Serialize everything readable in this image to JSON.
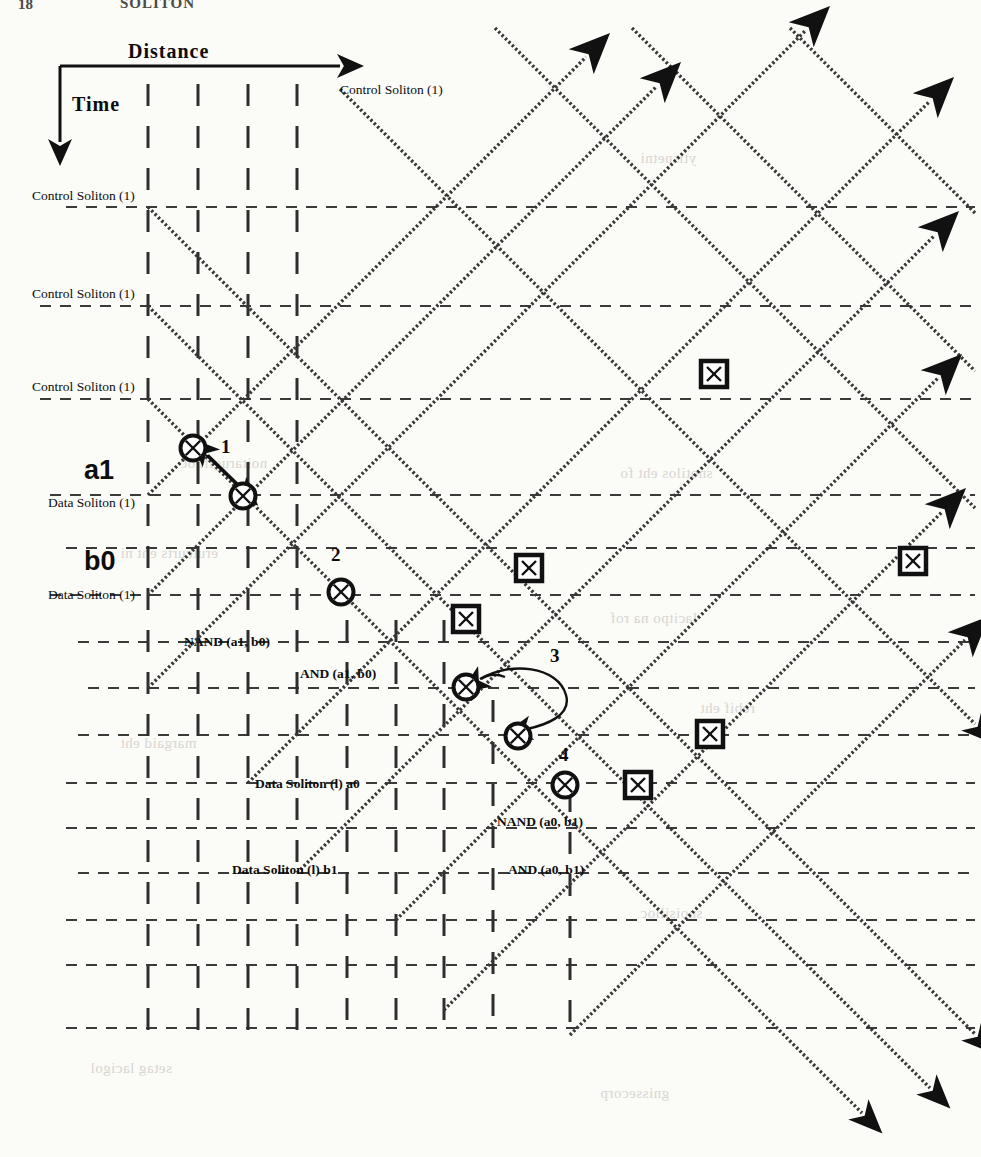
{
  "figure": {
    "type": "spacetime-soliton-collision-diagram",
    "axes": {
      "x_label": "Distance",
      "y_label": "Time"
    },
    "header_fragment": "SOLITON",
    "labels": {
      "control_soliton": "Control Soliton (1)",
      "data_soliton": "Data Soliton (1)",
      "data_soliton_a0": "Data Soliton (l) a0",
      "data_soliton_b1": "Data Soliton (l) b1",
      "nand_a1b0": "NAND (a1, b0)",
      "and_a1b0": "AND (a1, b0)",
      "nand_a0b1": "NAND (a0, b1)",
      "and_a0b1": "AND (a0, b1)",
      "a1": "a1",
      "b0": "b0"
    },
    "collision_numbers": [
      "1",
      "2",
      "3",
      "4"
    ],
    "annotations": [
      {
        "id": "control-soliton-top",
        "text": "Control Soliton (1)",
        "x": 340,
        "y": 89
      },
      {
        "id": "control-soliton-1",
        "text": "Control Soliton (1)",
        "x": 32,
        "y": 196
      },
      {
        "id": "control-soliton-2",
        "text": "Control Soliton (1)",
        "x": 32,
        "y": 293
      },
      {
        "id": "control-soliton-3",
        "text": "Control Soliton (1)",
        "x": 32,
        "y": 386
      },
      {
        "id": "data-soliton-a1",
        "text": "Data Soliton (1)",
        "x": 48,
        "y": 500
      },
      {
        "id": "data-soliton-b0",
        "text": "Data Soliton (1)",
        "x": 48,
        "y": 592
      },
      {
        "id": "label-a1",
        "text": "a1",
        "x": 88,
        "y": 463
      },
      {
        "id": "label-b0",
        "text": "b0",
        "x": 88,
        "y": 554
      },
      {
        "id": "nand-a1-b0",
        "text": "NAND (a1, b0)",
        "x": 185,
        "y": 641
      },
      {
        "id": "and-a1-b0",
        "text": "AND (a1, b0)",
        "x": 300,
        "y": 673
      },
      {
        "id": "data-soliton-a0",
        "text": "Data Soliton (l) a0",
        "x": 255,
        "y": 783
      },
      {
        "id": "nand-a0-b1",
        "text": "NAND (a0, b1)",
        "x": 497,
        "y": 821
      },
      {
        "id": "data-soliton-b1",
        "text": "Data Soliton (l) b1",
        "x": 235,
        "y": 869
      },
      {
        "id": "and-a0-b1",
        "text": "AND (a0, b1)",
        "x": 508,
        "y": 869
      }
    ],
    "collision_markers": [
      {
        "id": "c1",
        "kind": "circle-x",
        "x": 193,
        "y": 448,
        "number": "1",
        "num_x": 223,
        "num_y": 444
      },
      {
        "id": "c2",
        "kind": "circle-x",
        "x": 243,
        "y": 496,
        "number": "",
        "num_x": 0,
        "num_y": 0
      },
      {
        "id": "c3",
        "kind": "circle-x",
        "x": 341,
        "y": 592,
        "number": "2",
        "num_x": 333,
        "num_y": 554
      },
      {
        "id": "c4",
        "kind": "circle-x",
        "x": 466,
        "y": 687,
        "number": "3",
        "num_x": 553,
        "num_y": 655
      },
      {
        "id": "c5",
        "kind": "circle-x",
        "x": 518,
        "y": 736,
        "number": "",
        "num_x": 0,
        "num_y": 0
      },
      {
        "id": "c6",
        "kind": "circle-x",
        "x": 565,
        "y": 785,
        "number": "4",
        "num_x": 562,
        "num_y": 752
      }
    ],
    "box_markers": [
      {
        "id": "b1",
        "x": 714,
        "y": 374
      },
      {
        "id": "b2",
        "x": 529,
        "y": 568
      },
      {
        "id": "b3",
        "x": 466,
        "y": 619
      },
      {
        "id": "b4",
        "x": 913,
        "y": 561
      },
      {
        "id": "b5",
        "x": 710,
        "y": 734
      },
      {
        "id": "b6",
        "x": 638,
        "y": 785
      }
    ],
    "grid": {
      "horizontal_lines_y": [
        207,
        306,
        399,
        495,
        548,
        595,
        642,
        688,
        735,
        783,
        828,
        873,
        920,
        965,
        1028
      ],
      "vertical_lines_x": [
        148,
        198,
        248,
        297,
        347,
        396,
        444,
        493,
        570
      ],
      "h_line_x_start": 66,
      "h_line_x_end": 975,
      "v_line_y_start": 84,
      "v_line_y_end": 1035
    }
  }
}
